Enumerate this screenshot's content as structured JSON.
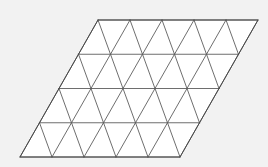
{
  "figure": {
    "background_color": "#f2f2f2",
    "fill_color": "#ffffff",
    "line_color": "#5d5d5d",
    "outline_color": "#4a4a4a",
    "line_width": 0.9
  },
  "chart_data": {
    "type": "diagram",
    "title": "",
    "subtitle": "",
    "xlabel": "",
    "ylabel": "",
    "shape": "rhombus",
    "tiling": "equilateral-triangles",
    "columns": 5,
    "rows": 4,
    "triangle_count": 40,
    "upward_triangles": 20,
    "downward_triangles": 20,
    "cell_width": 32,
    "row_height": 34.25,
    "row_shear": 19.5,
    "corners": {
      "top_left": [
        98,
        20
      ],
      "top_right": [
        258,
        20
      ],
      "bottom_right": [
        180,
        157
      ],
      "bottom_left": [
        20,
        157
      ]
    },
    "row_y": [
      20,
      54.25,
      88.5,
      122.75,
      157
    ],
    "row_x_start": [
      98,
      78.5,
      59,
      39.5,
      20
    ],
    "legend": [],
    "annotations": [],
    "grid": true
  }
}
